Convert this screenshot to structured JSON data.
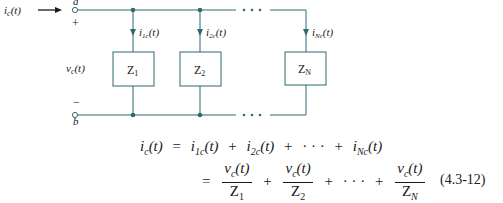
{
  "circuit": {
    "input_current_label": "i_c(t)",
    "node_top_label": "a",
    "node_bottom_label": "b",
    "plus_sign": "+",
    "minus_sign": "−",
    "voltage_label": "v_c(t)",
    "ellipsis": "• • •",
    "wire_color": "#2e6b6e",
    "branches": [
      {
        "impedance": "Z",
        "impedance_sub": "1",
        "current": "i",
        "current_sub": "1c",
        "current_arg": "(t)"
      },
      {
        "impedance": "Z",
        "impedance_sub": "2",
        "current": "i",
        "current_sub": "2c",
        "current_arg": "(t)"
      },
      {
        "impedance": "Z",
        "impedance_sub": "N",
        "current": "i",
        "current_sub": "Nc",
        "current_arg": "(t)"
      }
    ]
  },
  "equation": {
    "line1": {
      "lhs": "i",
      "lhs_sub": "c",
      "lhs_arg": "(t)",
      "equals": "=",
      "terms": [
        {
          "sym": "i",
          "sub": "1c",
          "arg": "(t)"
        },
        {
          "sym": "i",
          "sub": "2c",
          "arg": "(t)"
        },
        {
          "sym": "i",
          "sub": "Nc",
          "arg": "(t)"
        }
      ],
      "plus": "+",
      "dots": "· · ·"
    },
    "line2": {
      "equals": "=",
      "fractions": [
        {
          "num": "v",
          "num_sub": "c",
          "num_arg": "(t)",
          "den": "Z",
          "den_sub": "1"
        },
        {
          "num": "v",
          "num_sub": "c",
          "num_arg": "(t)",
          "den": "Z",
          "den_sub": "2"
        },
        {
          "num": "v",
          "num_sub": "c",
          "num_arg": "(t)",
          "den": "Z",
          "den_sub": "N"
        }
      ],
      "plus": "+",
      "dots": "· · ·"
    },
    "number": "(4.3-12)"
  }
}
